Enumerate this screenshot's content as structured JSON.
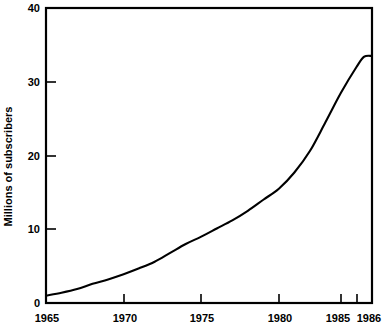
{
  "chart_data": {
    "type": "line",
    "title": "",
    "xlabel": "",
    "ylabel": "Millions of subscribers",
    "xlim": [
      1965,
      1986
    ],
    "ylim": [
      0,
      40
    ],
    "grid": false,
    "legend": null,
    "x_ticks": [
      "1965",
      "1970",
      "1975",
      "1980",
      "1985",
      "1986"
    ],
    "x_tick_values": [
      1965,
      1970,
      1975,
      1980,
      1985,
      1986
    ],
    "y_ticks": [
      "0",
      "10",
      "20",
      "30",
      "40"
    ],
    "y_tick_values": [
      0,
      10,
      20,
      30,
      40
    ],
    "series": [
      {
        "name": "Millions of subscribers",
        "color": "#000000",
        "x": [
          1965,
          1966,
          1967,
          1968,
          1969,
          1970,
          1971,
          1972,
          1973,
          1974,
          1975,
          1976,
          1977,
          1978,
          1979,
          1980,
          1981,
          1982,
          1983,
          1984,
          1985,
          1985.5,
          1986
        ],
        "values": [
          1.0,
          1.4,
          1.9,
          2.6,
          3.2,
          3.9,
          4.7,
          5.6,
          6.8,
          8.0,
          9.0,
          10.1,
          11.2,
          12.5,
          14.0,
          15.5,
          17.7,
          20.6,
          24.5,
          28.5,
          32.0,
          33.4,
          33.5
        ]
      }
    ],
    "annotations": []
  },
  "axis": {
    "y_title": "Millions of subscribers"
  }
}
